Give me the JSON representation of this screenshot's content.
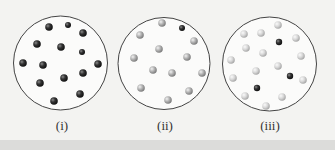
{
  "figure": {
    "panels": [
      {
        "label": "(i)",
        "circle": {
          "cx": 60.5,
          "cy": 63,
          "r": 47
        },
        "particles": [
          {
            "x": 49,
            "y": 27,
            "r": 3.8,
            "shade": "dark"
          },
          {
            "x": 68,
            "y": 25,
            "r": 3,
            "shade": "dark"
          },
          {
            "x": 83,
            "y": 33,
            "r": 3.8,
            "shade": "dark"
          },
          {
            "x": 37,
            "y": 44,
            "r": 3.8,
            "shade": "dark"
          },
          {
            "x": 61,
            "y": 47,
            "r": 3.8,
            "shade": "dark"
          },
          {
            "x": 82,
            "y": 52,
            "r": 3,
            "shade": "dark"
          },
          {
            "x": 23,
            "y": 63,
            "r": 3.8,
            "shade": "dark"
          },
          {
            "x": 43,
            "y": 65,
            "r": 3.8,
            "shade": "dark"
          },
          {
            "x": 98,
            "y": 64,
            "r": 3.8,
            "shade": "dark"
          },
          {
            "x": 64,
            "y": 78,
            "r": 3.8,
            "shade": "dark"
          },
          {
            "x": 83,
            "y": 73,
            "r": 3.8,
            "shade": "dark"
          },
          {
            "x": 40,
            "y": 83,
            "r": 3.8,
            "shade": "dark"
          },
          {
            "x": 80,
            "y": 94,
            "r": 3.8,
            "shade": "dark"
          },
          {
            "x": 54,
            "y": 101,
            "r": 3.8,
            "shade": "dark"
          }
        ]
      },
      {
        "label": "(ii)",
        "circle": {
          "cx": 164,
          "cy": 63.5,
          "r": 46
        },
        "particles": [
          {
            "x": 162,
            "y": 23,
            "r": 3.8,
            "shade": "light"
          },
          {
            "x": 182,
            "y": 28,
            "r": 3,
            "shade": "dark"
          },
          {
            "x": 140,
            "y": 35,
            "r": 3.8,
            "shade": "light"
          },
          {
            "x": 194,
            "y": 41,
            "r": 3.8,
            "shade": "light"
          },
          {
            "x": 159,
            "y": 49,
            "r": 3.8,
            "shade": "light"
          },
          {
            "x": 134,
            "y": 58,
            "r": 3.8,
            "shade": "light"
          },
          {
            "x": 187,
            "y": 57,
            "r": 3.8,
            "shade": "light"
          },
          {
            "x": 153,
            "y": 70,
            "r": 3.8,
            "shade": "light"
          },
          {
            "x": 172,
            "y": 73,
            "r": 3.8,
            "shade": "light"
          },
          {
            "x": 202,
            "y": 73,
            "r": 3.8,
            "shade": "light"
          },
          {
            "x": 141,
            "y": 88,
            "r": 3.8,
            "shade": "light"
          },
          {
            "x": 189,
            "y": 91,
            "r": 3.8,
            "shade": "light"
          },
          {
            "x": 168,
            "y": 100,
            "r": 3.8,
            "shade": "light"
          }
        ]
      },
      {
        "label": "(iii)",
        "circle": {
          "cx": 269.5,
          "cy": 64,
          "r": 47
        },
        "particles": [
          {
            "x": 278,
            "y": 25,
            "r": 3.8,
            "shade": "pale"
          },
          {
            "x": 244,
            "y": 34,
            "r": 3.8,
            "shade": "pale"
          },
          {
            "x": 261,
            "y": 33,
            "r": 3.8,
            "shade": "pale"
          },
          {
            "x": 279,
            "y": 42,
            "r": 3.2,
            "shade": "dark"
          },
          {
            "x": 296,
            "y": 38,
            "r": 3.8,
            "shade": "pale"
          },
          {
            "x": 246,
            "y": 48,
            "r": 3.8,
            "shade": "pale"
          },
          {
            "x": 263,
            "y": 53,
            "r": 3.8,
            "shade": "pale"
          },
          {
            "x": 231,
            "y": 60,
            "r": 3.8,
            "shade": "pale"
          },
          {
            "x": 301,
            "y": 56,
            "r": 3.8,
            "shade": "pale"
          },
          {
            "x": 278,
            "y": 66,
            "r": 3.8,
            "shade": "pale"
          },
          {
            "x": 256,
            "y": 71,
            "r": 3.8,
            "shade": "pale"
          },
          {
            "x": 290,
            "y": 76,
            "r": 3.2,
            "shade": "dark"
          },
          {
            "x": 233,
            "y": 78,
            "r": 3.8,
            "shade": "pale"
          },
          {
            "x": 303,
            "y": 80,
            "r": 3.8,
            "shade": "pale"
          },
          {
            "x": 257,
            "y": 88,
            "r": 3.2,
            "shade": "dark"
          },
          {
            "x": 245,
            "y": 96,
            "r": 3.8,
            "shade": "pale"
          },
          {
            "x": 282,
            "y": 97,
            "r": 3.8,
            "shade": "pale"
          },
          {
            "x": 266,
            "y": 106,
            "r": 3.8,
            "shade": "pale"
          }
        ]
      }
    ],
    "colors": {
      "background": "#f3f3f1",
      "circle_stroke": "#444444",
      "dark_particle": "#2a2a2a",
      "light_particle": "#a8a8a8",
      "pale_particle": "#cfcfcf"
    }
  }
}
